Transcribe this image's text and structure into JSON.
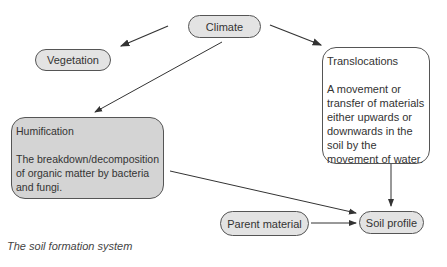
{
  "diagram": {
    "title": "The soil formation system",
    "nodes": {
      "climate": {
        "label": "Climate"
      },
      "vegetation": {
        "label": "Vegetation"
      },
      "translocations": {
        "title": "Translocations",
        "body": "A movement or transfer of materials either upwards or downwards in the soil by the movement of water."
      },
      "humification": {
        "title": "Humification",
        "body": "The breakdown/decomposition of organic matter by bacteria and fungi."
      },
      "parent_material": {
        "label": "Parent material"
      },
      "soil_profile": {
        "label": "Soil profile"
      }
    },
    "edges": [
      {
        "from": "Climate",
        "to": "Vegetation"
      },
      {
        "from": "Climate",
        "to": "Humification"
      },
      {
        "from": "Climate",
        "to": "Translocations"
      },
      {
        "from": "Translocations",
        "to": "Soil profile"
      },
      {
        "from": "Humification",
        "to": "Soil profile"
      },
      {
        "from": "Parent material",
        "to": "Soil profile"
      }
    ],
    "colors": {
      "pill_fill": "#e3e3e3",
      "humification_fill": "#d4d4d4",
      "translocations_fill": "#ffffff",
      "stroke": "#555555"
    }
  }
}
